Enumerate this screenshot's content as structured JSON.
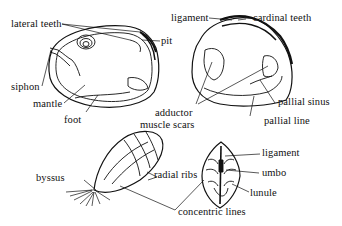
{
  "figures": {
    "clam_interior_soft": {
      "labels": {
        "lateral_teeth": "lateral teeth",
        "pit": "pit",
        "siphon": "siphon",
        "mantle": "mantle",
        "foot": "foot"
      }
    },
    "clam_shell_interior": {
      "labels": {
        "ligament": "ligament",
        "cardinal_teeth": "cardinal teeth",
        "pallial_sinus": "pallial sinus",
        "pallial_line": "pallial line",
        "adductor_line1": "adductor",
        "adductor_line2": "muscle scars"
      }
    },
    "mussel": {
      "labels": {
        "byssus": "byssus",
        "radial_ribs": "radial ribs"
      }
    },
    "shell_dorsal_view": {
      "labels": {
        "ligament": "ligament",
        "umbo": "umbo",
        "lunule": "lunule"
      }
    },
    "shared": {
      "concentric_lines": "concentric lines"
    }
  },
  "colors": {
    "ink": "#111111",
    "background": "#ffffff"
  }
}
